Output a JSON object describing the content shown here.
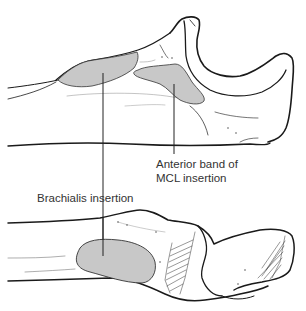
{
  "figure": {
    "type": "anatomical-line-drawing",
    "colors": {
      "line": "#1a1a1a",
      "insertion_fill": "#c8c8c8",
      "leader_line": "#222222",
      "background": "#ffffff"
    },
    "views": [
      {
        "name": "upper-view",
        "description": "lateral view of proximal ulna with olecranon and coronoid"
      },
      {
        "name": "lower-view",
        "description": "anterior view of proximal ulna"
      }
    ]
  },
  "labels": {
    "mcl": {
      "line1": "Anterior band of",
      "line2": "MCL insertion"
    },
    "brachialis": {
      "text": "Brachialis insertion"
    }
  }
}
